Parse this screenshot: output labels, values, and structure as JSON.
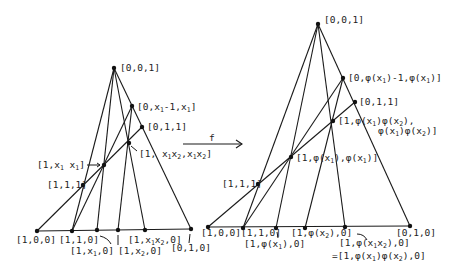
{
  "diagram": {
    "map_label": "f",
    "left": {
      "points": {
        "apex": {
          "label": "[0,0,1]",
          "x": 114,
          "y": 68
        },
        "p_0_x1m1_x1": {
          "label": "[0,x1-1,x1]",
          "x": 132,
          "y": 106
        },
        "p_011": {
          "label": "[0,1,1]",
          "x": 142,
          "y": 127
        },
        "p_1_x1x2_x1x2": {
          "label": "[1, x1x2,x1x2]",
          "x": 129,
          "y": 143
        },
        "p_1_x1_x1": {
          "label": "[1,x1 x1]",
          "x": 104,
          "y": 165
        },
        "p_111": {
          "label": "[1,1,1]",
          "x": 83,
          "y": 185
        },
        "p_100": {
          "label": "[1,0,0]",
          "x": 37,
          "y": 231
        },
        "p_110": {
          "label": "[1,1,0]",
          "x": 72,
          "y": 231
        },
        "p_1_x1_0": {
          "label": "[1,x1,0]",
          "x": 97,
          "y": 230
        },
        "p_1_x2_0": {
          "label": "[1,x2,0]",
          "x": 118,
          "y": 230
        },
        "p_1_x1x2_0": {
          "label": "[1,x1x2,0]",
          "x": 145,
          "y": 230
        },
        "p_010": {
          "label": "[0,1,0]",
          "x": 191,
          "y": 229
        }
      }
    },
    "right": {
      "points": {
        "apex": {
          "label": "[0,0,1]",
          "x": 318,
          "y": 24
        },
        "p_0_phx1m1": {
          "label": "[0,φ(x1)-1,φ(x1)]",
          "x": 343,
          "y": 78
        },
        "p_011": {
          "label": "[0,1,1]",
          "x": 355,
          "y": 102
        },
        "p_1_phph": {
          "label_line1": "[1,φ(x1)φ(x2),",
          "label_line2": "φ(x1)φ(x2)]",
          "x": 333,
          "y": 121
        },
        "p_1_phx1_phx1": {
          "label": "[1,φ(x1),φ(x1)]",
          "x": 291,
          "y": 157
        },
        "p_111": {
          "label": "[1,1,1]",
          "x": 258,
          "y": 184
        },
        "p_100": {
          "label": "[1,0,0]",
          "x": 208,
          "y": 227
        },
        "p_110": {
          "label": "[1,1,0]",
          "x": 243,
          "y": 228
        },
        "p_1_phx1_0": {
          "label": "[1,φ(x1),0]",
          "x": 276,
          "y": 228
        },
        "p_1_phx2_0": {
          "label": "[1,φ(x2),0]",
          "x": 305,
          "y": 228
        },
        "p_1_phx1x2_0": {
          "label_line1": "[1,φ(x1x2),0]",
          "label_line2": "=[1,φ(x1)φ(x2),0]",
          "x": 345,
          "y": 227
        },
        "p_010": {
          "label": "[0,1,0]",
          "x": 410,
          "y": 226
        }
      }
    }
  }
}
